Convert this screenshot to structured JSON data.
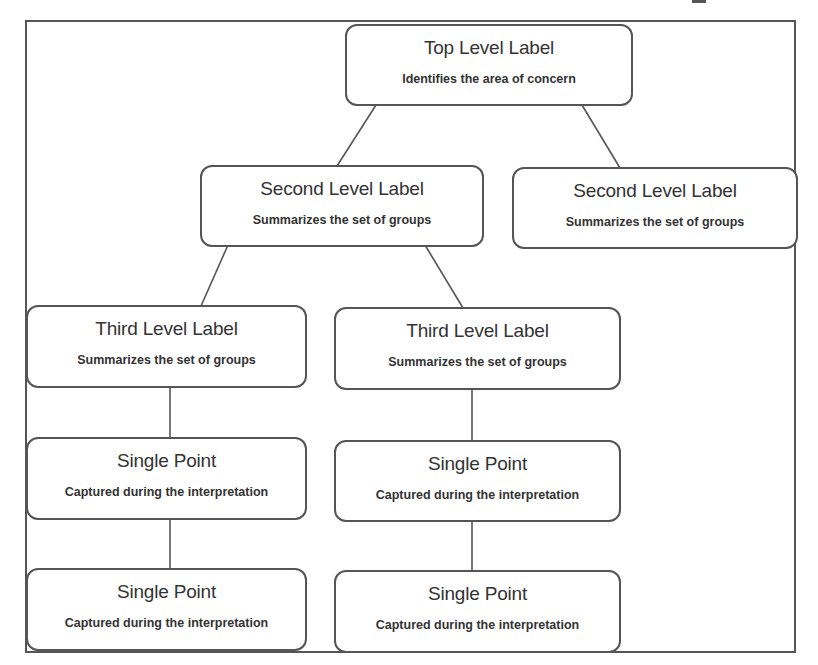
{
  "diagram": {
    "type": "hierarchy",
    "colors": {
      "stroke": "#555555",
      "text": "#333333",
      "background": "#ffffff"
    },
    "nodes": {
      "top": {
        "title": "Top Level Label",
        "subtitle": "Identifies the area of concern"
      },
      "second_left": {
        "title": "Second Level Label",
        "subtitle": "Summarizes the set of groups"
      },
      "second_right": {
        "title": "Second Level Label",
        "subtitle": "Summarizes the set of groups"
      },
      "third_left": {
        "title": "Third Level Label",
        "subtitle": "Summarizes the set of groups"
      },
      "third_right": {
        "title": "Third Level Label",
        "subtitle": "Summarizes the set of groups"
      },
      "point_left_1": {
        "title": "Single Point",
        "subtitle": "Captured during the interpretation"
      },
      "point_left_2": {
        "title": "Single Point",
        "subtitle": "Captured during the interpretation"
      },
      "point_right_1": {
        "title": "Single Point",
        "subtitle": "Captured during the interpretation"
      },
      "point_right_2": {
        "title": "Single Point",
        "subtitle": "Captured during the interpretation"
      }
    },
    "edges": [
      [
        "top",
        "second_left"
      ],
      [
        "top",
        "second_right"
      ],
      [
        "second_left",
        "third_left"
      ],
      [
        "second_left",
        "third_right"
      ],
      [
        "third_left",
        "point_left_1"
      ],
      [
        "point_left_1",
        "point_left_2"
      ],
      [
        "third_right",
        "point_right_1"
      ],
      [
        "point_right_1",
        "point_right_2"
      ]
    ]
  }
}
